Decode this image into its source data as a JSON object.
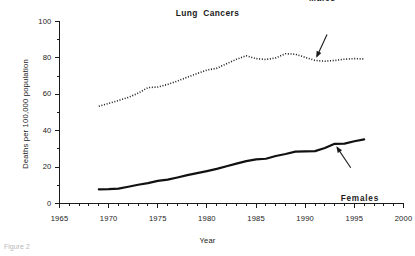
{
  "figure": {
    "caption": "Figure 2"
  },
  "chart_data": {
    "type": "line",
    "title": "Lung  Cancers",
    "xlabel": "Year",
    "ylabel": "Deaths per 100,000 population",
    "xlim": [
      1965,
      2000
    ],
    "ylim": [
      0,
      100
    ],
    "x_ticks": [
      1965,
      1970,
      1975,
      1980,
      1985,
      1990,
      1995,
      2000
    ],
    "x_tick_labels": [
      "1965",
      "1970",
      "1975",
      "1980",
      "1985",
      "1990",
      "1995",
      "2000"
    ],
    "x_minor_step": 1,
    "y_ticks": [
      0,
      20,
      40,
      60,
      80,
      100
    ],
    "y_tick_labels": [
      "0",
      "20",
      "40",
      "60",
      "80",
      "100"
    ],
    "y_minor_step": 10,
    "grid": false,
    "legend": "inline-annotations",
    "x": [
      1969,
      1970,
      1971,
      1972,
      1973,
      1974,
      1975,
      1976,
      1977,
      1978,
      1979,
      1980,
      1981,
      1982,
      1983,
      1984,
      1985,
      1986,
      1987,
      1988,
      1989,
      1990,
      1991,
      1992,
      1993,
      1994,
      1995,
      1996
    ],
    "series": [
      {
        "name": "Males",
        "style": "dotted",
        "values": [
          53.4,
          55.0,
          56.6,
          58.3,
          60.6,
          63.7,
          64.0,
          65.4,
          67.3,
          69.4,
          71.4,
          73.3,
          74.3,
          76.8,
          79.2,
          81.2,
          79.6,
          79.1,
          80.0,
          82.3,
          82.0,
          80.3,
          78.6,
          78.2,
          78.6,
          79.3,
          79.6,
          79.4
        ]
      },
      {
        "name": "Females",
        "style": "solid",
        "values": [
          7.8,
          7.9,
          8.2,
          9.2,
          10.3,
          11.2,
          12.4,
          13.1,
          14.3,
          15.6,
          16.7,
          17.8,
          19.0,
          20.5,
          21.9,
          23.3,
          24.2,
          24.6,
          26.1,
          27.2,
          28.5,
          28.6,
          28.8,
          30.5,
          32.8,
          32.9,
          34.2,
          35.2
        ]
      }
    ],
    "annotations": [
      {
        "label": "Males",
        "target_year": 1991,
        "target_value": 78.6
      },
      {
        "label": "Females",
        "target_year": 1993,
        "target_value": 32.8
      }
    ]
  }
}
